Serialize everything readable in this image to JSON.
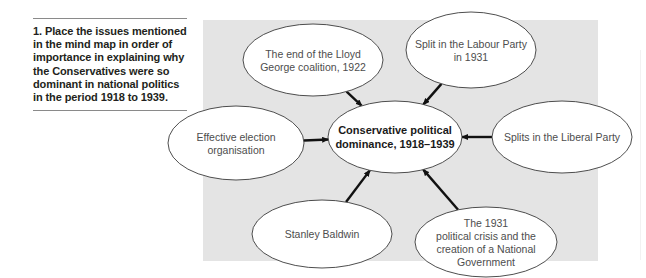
{
  "question": {
    "text": "1. Place the issues mentioned in the mind map in order of importance in explaining why the Conservatives were so dominant in national politics in the period 1918 to 1939."
  },
  "mind_map": {
    "panel_color": "#e4e4e4",
    "central": {
      "id": "central",
      "lines": [
        "Conservative political",
        "dominance, 1918–1939"
      ]
    },
    "nodes": [
      {
        "id": "lloyd-george",
        "lines": [
          "The end of the Lloyd",
          "George coalition, 1922"
        ]
      },
      {
        "id": "labour-split",
        "lines": [
          "Split in the Labour Party",
          "in 1931"
        ]
      },
      {
        "id": "election-organisation",
        "lines": [
          "Effective election",
          "organisation"
        ]
      },
      {
        "id": "liberal-splits",
        "lines": [
          "Splits in the Liberal Party"
        ]
      },
      {
        "id": "stanley-baldwin",
        "lines": [
          "Stanley Baldwin"
        ]
      },
      {
        "id": "crisis-1931",
        "lines": [
          "The 1931",
          "political crisis and the",
          "creation of a National",
          "Government"
        ]
      }
    ],
    "edges": [
      {
        "from": "lloyd-george",
        "to": "central"
      },
      {
        "from": "labour-split",
        "to": "central"
      },
      {
        "from": "election-organisation",
        "to": "central"
      },
      {
        "from": "liberal-splits",
        "to": "central"
      },
      {
        "from": "stanley-baldwin",
        "to": "central"
      },
      {
        "from": "crisis-1931",
        "to": "central"
      }
    ]
  }
}
